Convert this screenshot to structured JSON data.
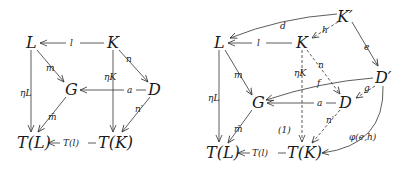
{
  "diagrams": [
    {
      "id": "left",
      "nodes": {
        "L": "L",
        "K": "K",
        "G": "G",
        "D": "D",
        "TL": "T(L)",
        "TK": "T(K)"
      },
      "edges": {
        "l": "l",
        "m": "m",
        "n": "n",
        "etaL": "ηL",
        "etaK": "ηK",
        "a": "a",
        "nprime": "n′",
        "mbar": "m̄",
        "Tl": "T(l)"
      }
    },
    {
      "id": "right",
      "nodes": {
        "Kp": "K′",
        "L": "L",
        "K": "K",
        "Dp": "D′",
        "G": "G",
        "D": "D",
        "TL": "T(L)",
        "TK": "T(K)"
      },
      "edges": {
        "d": "d",
        "h": "h",
        "e": "e",
        "l": "l",
        "m": "m",
        "n": "n",
        "etaL": "ηL",
        "etaK": "ηK",
        "f": "f",
        "g": "g",
        "a": "a",
        "nprime": "n′",
        "mbar": "m̄",
        "Tl": "T(l)",
        "phi": "φ(e,h)",
        "region": "(1)"
      }
    }
  ]
}
